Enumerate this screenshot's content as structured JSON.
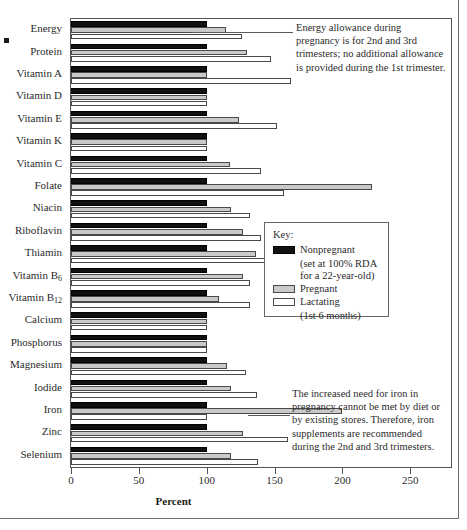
{
  "chart_data": {
    "type": "bar",
    "orientation": "horizontal",
    "title": "",
    "xlabel": "Percent",
    "ylabel": "",
    "xlim": [
      0,
      280
    ],
    "xticks": [
      0,
      50,
      100,
      150,
      200,
      250
    ],
    "xtick_labels": [
      "0",
      "50",
      "100",
      "150",
      "200",
      "250"
    ],
    "grid": false,
    "legend_position": "center-right",
    "categories": [
      "Energy",
      "Protein",
      "Vitamin A",
      "Vitamin D",
      "Vitamin E",
      "Vitamin K",
      "Vitamin C",
      "Folate",
      "Niacin",
      "Riboflavin",
      "Thiamin",
      "Vitamin B6",
      "Vitamin B12",
      "Calcium",
      "Phosphorus",
      "Magnesium",
      "Iodide",
      "Iron",
      "Zinc",
      "Selenium"
    ],
    "category_labels_html": [
      "Energy",
      "Protein",
      "Vitamin A",
      "Vitamin D",
      "Vitamin E",
      "Vitamin K",
      "Vitamin C",
      "Folate",
      "Niacin",
      "Riboflavin",
      "Thiamin",
      "Vitamin B<sub>6</sub>",
      "Vitamin B<sub>12</sub>",
      "Calcium",
      "Phosphorus",
      "Magnesium",
      "Iodide",
      "Iron",
      "Zinc",
      "Selenium"
    ],
    "series": [
      {
        "name": "Nonpregnant",
        "color": "#111111",
        "values": [
          100,
          100,
          100,
          100,
          100,
          100,
          100,
          100,
          100,
          100,
          100,
          100,
          100,
          100,
          100,
          100,
          100,
          100,
          100,
          100
        ]
      },
      {
        "name": "Pregnant",
        "color": "#c9c9c9",
        "values": [
          114,
          130,
          100,
          100,
          124,
          100,
          117,
          222,
          118,
          127,
          136,
          127,
          109,
          100,
          100,
          115,
          118,
          200,
          127,
          118
        ]
      },
      {
        "name": "Lactating",
        "color": "#ffffff",
        "values": [
          126,
          147,
          162,
          100,
          152,
          100,
          140,
          157,
          132,
          140,
          145,
          132,
          132,
          100,
          100,
          129,
          137,
          100,
          160,
          138
        ]
      }
    ]
  },
  "legend": {
    "title": "Key:",
    "entries": [
      {
        "label": "Nonpregnant",
        "sublines": [
          "(set at 100% RDA",
          "for a 22-year-old)"
        ],
        "swatch": "nonpregnant"
      },
      {
        "label": "Pregnant",
        "sublines": [],
        "swatch": "pregnant"
      },
      {
        "label": "Lactating",
        "sublines": [
          "(1st 6 months)"
        ],
        "swatch": "lactating"
      }
    ]
  },
  "annotations": {
    "energy": "Energy allowance during pregnancy is for 2nd and 3rd trimesters; no additional allowance is provided during the 1st trimester.",
    "iron": "The increased need for iron in pregnancy cannot be met by diet or by existing stores. Therefore, iron supplements are recommended during the 2nd and 3rd trimesters."
  }
}
